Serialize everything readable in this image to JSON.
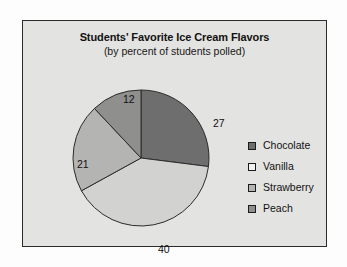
{
  "chart_data": {
    "type": "pie",
    "title": "Students' Favorite Ice Cream Flavors",
    "subtitle": "(by percent of students polled)",
    "xlabel": "",
    "ylabel": "",
    "units": "percent",
    "legend_position": "right",
    "grid": false,
    "start_angle_deg": 0,
    "direction": "clockwise",
    "categories": [
      "Chocolate",
      "Vanilla",
      "Strawberry",
      "Peach"
    ],
    "values": [
      27,
      40,
      21,
      12
    ],
    "slices": [
      {
        "label": "Chocolate",
        "value": 27,
        "value_text": "27",
        "color": "#6e6e6e"
      },
      {
        "label": "Vanilla",
        "value": 40,
        "value_text": "40",
        "color": "#d2d2d0"
      },
      {
        "label": "Strawberry",
        "value": 21,
        "value_text": "21",
        "color": "#b4b4b2"
      },
      {
        "label": "Peach",
        "value": 12,
        "value_text": "12",
        "color": "#8f8f8d"
      }
    ]
  },
  "colors": {
    "page_background": "#fdfdfd",
    "chart_background": "#e3e3e1",
    "frame_border": "#2b2b2b",
    "slice_outline": "#2b2b2b",
    "text": "#111111",
    "chocolate": "#6e6e6e",
    "vanilla": "#d2d2d0",
    "strawberry": "#b4b4b2",
    "peach": "#8f8f8d"
  },
  "legend": {
    "items": [
      {
        "label": "Chocolate",
        "color": "#6e6e6e"
      },
      {
        "label": "Vanilla",
        "color": "#f2f2f0"
      },
      {
        "label": "Strawberry",
        "color": "#b4b4b2"
      },
      {
        "label": "Peach",
        "color": "#8f8f8d"
      }
    ]
  }
}
